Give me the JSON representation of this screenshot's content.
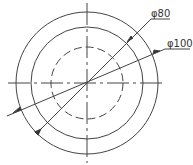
{
  "drawing": {
    "center": [
      87,
      83
    ],
    "circles": [
      {
        "name": "outer",
        "r": 71,
        "style": "solid"
      },
      {
        "name": "middle",
        "r": 56,
        "style": "solid"
      },
      {
        "name": "inner",
        "r": 36,
        "style": "dashed"
      }
    ],
    "dimensions": [
      {
        "label": "φ80",
        "target": "middle"
      },
      {
        "label": "φ100",
        "target": "outer"
      }
    ],
    "line_color": "#444444"
  }
}
